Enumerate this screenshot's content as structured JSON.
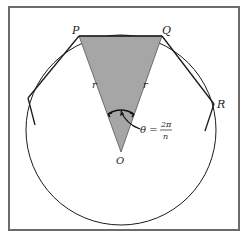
{
  "figure": {
    "labels": {
      "P": "P",
      "Q": "Q",
      "R": "R",
      "O": "O",
      "r_left": "r",
      "r_right": "r",
      "theta": "θ =",
      "theta_num": "2π",
      "theta_den": "n"
    },
    "colors": {
      "frame": "#6b6b6b",
      "triangle_fill": "#a6a6a6",
      "lines": "#1a1a1a",
      "background": "#ffffff"
    }
  }
}
